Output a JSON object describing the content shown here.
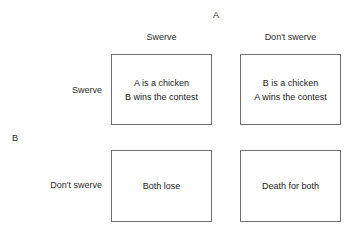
{
  "diagram": {
    "type": "payoff-matrix",
    "column_player": "A",
    "row_player": "B",
    "column_headers": [
      "Swerve",
      "Don't swerve"
    ],
    "row_headers": [
      "Swerve",
      "Don't swerve"
    ],
    "cells": [
      [
        {
          "lines": [
            "A is a chicken",
            "B wins the contest"
          ]
        },
        {
          "lines": [
            "B is a chicken",
            "A wins the contest"
          ]
        }
      ],
      [
        {
          "lines": [
            "Both lose"
          ]
        },
        {
          "lines": [
            "Death for both"
          ]
        }
      ]
    ],
    "colors": {
      "background": "#ffffff",
      "border": "#6f6f6f",
      "text": "#1a1a1a"
    }
  }
}
